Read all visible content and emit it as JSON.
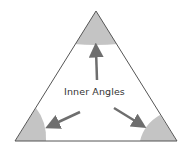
{
  "diagram": {
    "label": "Inner Angles",
    "colors": {
      "outline": "#555555",
      "wedge_fill": "#c4c4c4",
      "arrow": "#6e6e6e",
      "text": "#333333"
    },
    "shapes": [
      "triangle",
      "top-angle-wedge",
      "bottom-left-angle-wedge",
      "bottom-right-angle-wedge"
    ],
    "arrows": [
      "arrow-to-top-angle",
      "arrow-to-bottom-left-angle",
      "arrow-to-bottom-right-angle"
    ]
  }
}
